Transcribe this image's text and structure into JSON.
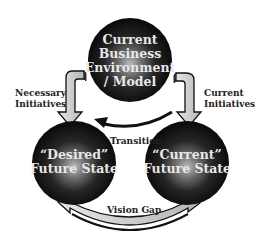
{
  "diagram": {
    "colors": {
      "sphere_dark": "#050505",
      "sphere_highlight": "#bdbdbd",
      "sphere_text": "#e8e8e8",
      "arrow_fill": "#cccccc",
      "arrow_stroke": "#111111",
      "label_text": "#222222",
      "background": "#ffffff"
    },
    "nodes": {
      "top": {
        "line1": "Current",
        "line2": "Business",
        "line3": "Environment",
        "line4": "/ Model"
      },
      "left": {
        "line1": "“Desired”",
        "line2": "Future State"
      },
      "right": {
        "line1": "“Current”",
        "line2": "Future State"
      }
    },
    "edges": {
      "necessary": {
        "line1": "Necessary",
        "line2": "Initiatives"
      },
      "current": {
        "line1": "Current",
        "line2": "Initiatives"
      },
      "transition": {
        "label": "Transition"
      },
      "vision_gap": {
        "label": "Vision Gap"
      }
    }
  }
}
